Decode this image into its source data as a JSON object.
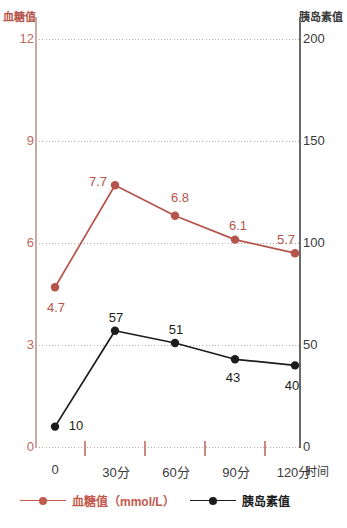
{
  "chart_data": {
    "type": "line",
    "title": "",
    "xlabel": "时间",
    "categories": [
      "0",
      "30分",
      "60分",
      "90分",
      "120分"
    ],
    "grid": true,
    "legend_position": "bottom",
    "axes": {
      "left": {
        "name": "血糖值",
        "unit": "mmol/L",
        "ticks": [
          "0",
          "3",
          "6",
          "9",
          "12"
        ],
        "tick_values": [
          0,
          3,
          6,
          9,
          12
        ],
        "ylim": [
          0,
          12
        ],
        "color": "#b5544a"
      },
      "right": {
        "name": "胰岛素值",
        "ticks": [
          "0",
          "50",
          "100",
          "150",
          "200"
        ],
        "tick_values": [
          0,
          50,
          100,
          150,
          200
        ],
        "ylim": [
          0,
          200
        ],
        "color": "#3a3a3a"
      }
    },
    "series": [
      {
        "name": "血糖值（mmol/L）",
        "legend_label": "血糖值（mmol/L）",
        "axis": "left",
        "color": "#b5544a",
        "values": [
          4.7,
          7.7,
          6.8,
          6.1,
          5.7
        ],
        "labels": [
          "4.7",
          "7.7",
          "6.8",
          "6.1",
          "5.7"
        ]
      },
      {
        "name": "胰岛素值",
        "legend_label": "胰岛素值",
        "axis": "right",
        "color": "#1c1c1c",
        "values": [
          10,
          57,
          51,
          43,
          40
        ],
        "labels": [
          "10",
          "57",
          "51",
          "43",
          "40"
        ]
      }
    ]
  }
}
